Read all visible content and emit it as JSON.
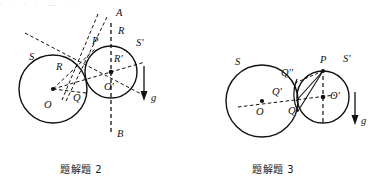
{
  "page": {
    "width": 372,
    "height": 182,
    "background": "#ffffff",
    "ink": "#111111",
    "top_cropped_text": "· · · · — · ·"
  },
  "figures": [
    {
      "id": "figure-2",
      "caption": "题解题 2",
      "description": "Two tangent circles S and S' with construction lines, vertical axis AB through circle S', and gravity vector g.",
      "labels": [
        {
          "name": "label-A",
          "text": "A",
          "x": 116,
          "y": 16,
          "style": "italic"
        },
        {
          "name": "label-B",
          "text": "B",
          "x": 117,
          "y": 137,
          "style": "italic"
        },
        {
          "name": "label-S",
          "text": "S",
          "x": 29,
          "y": 60,
          "style": "italic"
        },
        {
          "name": "label-S-prime",
          "text": "S'",
          "x": 136,
          "y": 46,
          "style": "italic"
        },
        {
          "name": "label-P",
          "text": "P",
          "x": 92,
          "y": 44,
          "style": "italic"
        },
        {
          "name": "label-R-outer",
          "text": "R",
          "x": 111,
          "y": 34,
          "style": "italic"
        },
        {
          "name": "label-R-inner",
          "text": "R",
          "x": 56,
          "y": 70,
          "style": "italic"
        },
        {
          "name": "label-R-prime",
          "text": "R'",
          "x": 111,
          "y": 62,
          "style": "italic"
        },
        {
          "name": "label-O",
          "text": "O",
          "x": 40,
          "y": 108,
          "style": "italic"
        },
        {
          "name": "label-O-prime",
          "text": "O'",
          "x": 101,
          "y": 90,
          "style": "italic"
        },
        {
          "name": "label-Q",
          "text": "Q",
          "x": 75,
          "y": 99,
          "style": "italic"
        },
        {
          "name": "label-g",
          "text": "g",
          "x": 153,
          "y": 98,
          "style": "italic"
        }
      ],
      "circles": [
        {
          "name": "circle-S",
          "cx": 53,
          "cy": 89,
          "r": 34
        },
        {
          "name": "circle-S-prime",
          "cx": 111,
          "cy": 72,
          "r": 26
        }
      ],
      "points": [
        {
          "name": "center-O",
          "cx": 53,
          "cy": 89
        },
        {
          "name": "center-O-prime",
          "cx": 111,
          "cy": 72
        }
      ],
      "gravity": {
        "name": "gravity-arrow",
        "x": 144,
        "y1": 66,
        "y2": 98
      }
    },
    {
      "id": "figure-3",
      "caption": "题解题 3",
      "description": "Two tangent circles S and S' with chord construction from P to tangency region, points Q, Q', Q'' marked, and gravity vector g.",
      "labels": [
        {
          "name": "label-S",
          "text": "S",
          "x": 237,
          "y": 65,
          "style": "italic"
        },
        {
          "name": "label-S-prime",
          "text": "S'",
          "x": 345,
          "y": 62,
          "style": "italic"
        },
        {
          "name": "label-P",
          "text": "P",
          "x": 320,
          "y": 54,
          "style": "italic"
        },
        {
          "name": "label-Q-dprime",
          "text": "Q''",
          "x": 288,
          "y": 73,
          "style": "italic"
        },
        {
          "name": "label-Q-prime",
          "text": "Q'",
          "x": 277,
          "y": 94,
          "style": "italic"
        },
        {
          "name": "label-Q",
          "text": "Q",
          "x": 290,
          "y": 113,
          "style": "italic"
        },
        {
          "name": "label-O",
          "text": "O",
          "x": 258,
          "y": 114,
          "style": "italic"
        },
        {
          "name": "label-O-prime",
          "text": "O'",
          "x": 330,
          "y": 97,
          "style": "italic"
        },
        {
          "name": "label-g",
          "text": "g",
          "x": 363,
          "y": 121,
          "style": "italic"
        }
      ],
      "circles": [
        {
          "name": "circle-S",
          "cx": 262,
          "cy": 101,
          "r": 36
        },
        {
          "name": "circle-S-prime",
          "cx": 323,
          "cy": 97,
          "r": 26
        }
      ],
      "points": [
        {
          "name": "center-O",
          "cx": 262,
          "cy": 101
        },
        {
          "name": "center-O-prime",
          "cx": 323,
          "cy": 97
        },
        {
          "name": "point-P",
          "cx": 323,
          "cy": 71
        }
      ],
      "gravity": {
        "name": "gravity-arrow",
        "x": 355,
        "y1": 92,
        "y2": 122
      }
    }
  ]
}
